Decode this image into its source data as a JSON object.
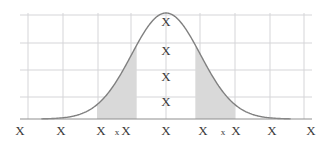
{
  "chart_data": {
    "type": "area",
    "title": "",
    "subtitle": "",
    "xlabel": "",
    "ylabel": "",
    "curve": {
      "name": "normal-distribution",
      "mean": 0,
      "sigma": 1,
      "stroke_color": "#808080",
      "stroke_width": 1.4,
      "fill_color": "#d9d9d9"
    },
    "shaded_regions": [
      {
        "name": "left-band",
        "from": -2.0,
        "to": -0.85,
        "fill": "#d9d9d9"
      },
      {
        "name": "right-band",
        "from": 0.85,
        "to": 2.0,
        "fill": "#d9d9d9"
      }
    ],
    "grid": {
      "show": true,
      "color": "#d5d5d8",
      "horizontal_count": 4,
      "vertical_count": 9
    },
    "axis": {
      "color": "#8f8f8f",
      "xlim": [
        -3.6,
        3.6
      ],
      "ylim": [
        0,
        1.08
      ]
    },
    "x_ticks": [
      {
        "label": "X",
        "x_px": 20,
        "size": "normal"
      },
      {
        "label": "X",
        "x_px": 61,
        "size": "normal"
      },
      {
        "label": "X",
        "x_px": 101,
        "size": "normal"
      },
      {
        "label": "x",
        "x_px": 117,
        "size": "small"
      },
      {
        "label": "X",
        "x_px": 126,
        "size": "normal"
      },
      {
        "label": "X",
        "x_px": 166,
        "size": "normal"
      },
      {
        "label": "X",
        "x_px": 203,
        "size": "normal"
      },
      {
        "label": "x",
        "x_px": 223,
        "size": "small"
      },
      {
        "label": "X",
        "x_px": 236,
        "size": "normal"
      },
      {
        "label": "X",
        "x_px": 272,
        "size": "normal"
      },
      {
        "label": "X",
        "x_px": 311,
        "size": "normal"
      }
    ],
    "y_ticks": [
      {
        "label": "X",
        "x_px": 166,
        "y_px": 21
      },
      {
        "label": "X",
        "x_px": 166,
        "y_px": 50
      },
      {
        "label": "X",
        "x_px": 166,
        "y_px": 76
      },
      {
        "label": "X",
        "x_px": 166,
        "y_px": 101
      }
    ],
    "vertical_gridlines_px": [
      28,
      63,
      98,
      131,
      166,
      200,
      235,
      270,
      304
    ],
    "horizontal_gridlines_px": [
      15,
      43,
      70,
      97
    ],
    "axis_line": {
      "y_px": 119,
      "x_start_px": 20,
      "x_end_px": 312
    }
  }
}
